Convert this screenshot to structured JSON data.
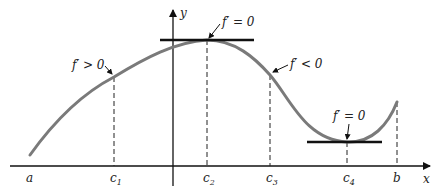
{
  "diagram": {
    "axes": {
      "x_label": "x",
      "y_label": "y"
    },
    "ticks": [
      {
        "id": "a",
        "label": "a",
        "sub": ""
      },
      {
        "id": "c1",
        "label": "c",
        "sub": "1"
      },
      {
        "id": "c2",
        "label": "c",
        "sub": "2"
      },
      {
        "id": "c3",
        "label": "c",
        "sub": "3"
      },
      {
        "id": "c4",
        "label": "c",
        "sub": "4"
      },
      {
        "id": "b",
        "label": "b",
        "sub": ""
      }
    ],
    "annotations": {
      "increasing": "f′ > 0",
      "max_tangent": "f′ = 0",
      "decreasing": "f′ < 0",
      "min_tangent": "f′ = 0"
    },
    "colors": {
      "curve": "#7a7a7a",
      "axis": "#111111",
      "tangent": "#111111"
    }
  }
}
